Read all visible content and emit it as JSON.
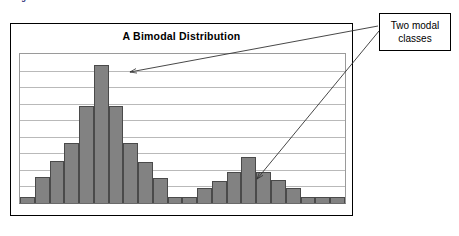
{
  "caption": "Histogram of a Bimodal Distribution",
  "chart": {
    "title": "A Bimodal Distribution"
  },
  "annotations": {
    "callout_label": "Two modal classes"
  },
  "colors": {
    "bar_fill": "#828282",
    "bar_outline": "#4a4a4a",
    "gridline": "#b9b9b9",
    "frame": "#000000",
    "caption_text": "#1a1a6e",
    "arrow": "#333333"
  },
  "chart_data": {
    "type": "bar",
    "title": "A Bimodal Distribution",
    "subtitle": "Histogram of a Bimodal Distribution",
    "xlabel": "",
    "ylabel": "",
    "grid": true,
    "legend": "none",
    "ylim": [
      0,
      9
    ],
    "gridline_count": 8,
    "categories": [
      "1",
      "2",
      "3",
      "4",
      "5",
      "6",
      "7",
      "8",
      "9",
      "10",
      "11",
      "12",
      "13",
      "14",
      "15",
      "16",
      "17",
      "18",
      "19",
      "20",
      "21",
      "22"
    ],
    "values": [
      0.35,
      1.55,
      2.55,
      3.65,
      5.85,
      8.35,
      5.85,
      3.65,
      2.5,
      1.5,
      0.35,
      0.35,
      0.9,
      1.35,
      1.9,
      2.8,
      1.9,
      1.4,
      0.9,
      0.35,
      0.35,
      0.35
    ],
    "annotations": [
      {
        "text": "Two modal classes",
        "points_to": [
          "bar 6 (first mode peak)",
          "bar 16 (second mode peak)"
        ]
      }
    ]
  }
}
